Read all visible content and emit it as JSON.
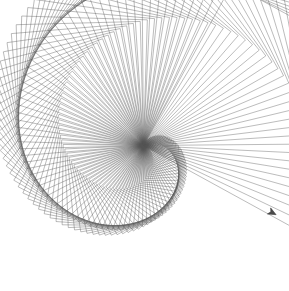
{
  "canvas": {
    "width": 289,
    "height": 291,
    "background_color": "#ffffff",
    "title": "Turtle Graphics Square Spiral"
  },
  "drawing": {
    "name": "square-spiral-spirograph",
    "description": "Nested squares drawn from a shared origin, each successive square slightly larger and rotated, forming two interlocking spiral envelope arms.",
    "shape": "square",
    "sides": 4,
    "interior_turn_degrees": 90,
    "iterations": 112,
    "start_side_length": 4.2,
    "side_length_growth": 1.62,
    "rotation_step_degrees": 3.25,
    "initial_heading_degrees": -62,
    "origin_x": 143.5,
    "origin_y": 145.5,
    "stroke_color": "#555555",
    "stroke_width": 0.55,
    "stroke_opacity": 0.72,
    "pen_down": true
  },
  "turtle": {
    "visible": true,
    "x": 272,
    "y": 212.5,
    "heading_degrees": 28,
    "size": 7.5,
    "fill_color": "#4a4a4a",
    "outline_color": "#3a3a3a",
    "shape": "turtle-arrow-cursor"
  },
  "extents": {
    "left": 14,
    "top": 16,
    "right": 273,
    "bottom": 279
  }
}
